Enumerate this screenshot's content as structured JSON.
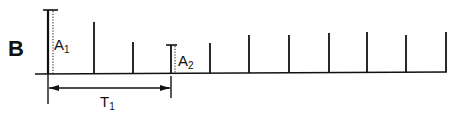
{
  "figure": {
    "panel_label": "B",
    "colors": {
      "ink": "#111111",
      "background": "#ffffff"
    },
    "baseline": {
      "x_start": 35,
      "x_end": 447,
      "y_left": 74,
      "y_right": 72
    },
    "spikes": [
      {
        "x": 48,
        "top": 10,
        "label": "A1",
        "capped": true,
        "dotted": true
      },
      {
        "x": 94,
        "top": 22
      },
      {
        "x": 133,
        "top": 42
      },
      {
        "x": 171,
        "top": 45,
        "label": "A2",
        "capped": true,
        "dotted": true
      },
      {
        "x": 210,
        "top": 43
      },
      {
        "x": 249,
        "top": 35
      },
      {
        "x": 289,
        "top": 35
      },
      {
        "x": 329,
        "top": 33
      },
      {
        "x": 367,
        "top": 32
      },
      {
        "x": 406,
        "top": 35
      },
      {
        "x": 446,
        "top": 32
      }
    ],
    "labels": {
      "a1_main": "A",
      "a1_sub": "1",
      "a2_main": "A",
      "a2_sub": "2",
      "t1_main": "T",
      "t1_sub": "1"
    },
    "interval": {
      "x_start": 48,
      "x_end": 171,
      "y": 88,
      "label": "T1"
    }
  }
}
